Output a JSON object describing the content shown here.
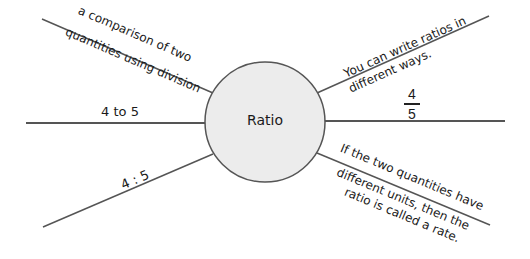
{
  "diagram": {
    "type": "concept-web",
    "center": {
      "label": "Ratio",
      "fill": "#ececec",
      "stroke": "#555555"
    },
    "line_color": "#555555",
    "branches": [
      {
        "id": "upper-left",
        "line1": "a comparison of two",
        "line2": "quantities using division"
      },
      {
        "id": "left",
        "text": "4 to 5"
      },
      {
        "id": "lower-left",
        "text": "4 : 5"
      },
      {
        "id": "upper-right",
        "line1": "You can write ratios in",
        "line2": "different ways."
      },
      {
        "id": "right",
        "numerator": "4",
        "denominator": "5"
      },
      {
        "id": "lower-right",
        "line1": "If the two quantities have",
        "line2": "different units, then the",
        "line3": "ratio is called a rate."
      }
    ]
  }
}
